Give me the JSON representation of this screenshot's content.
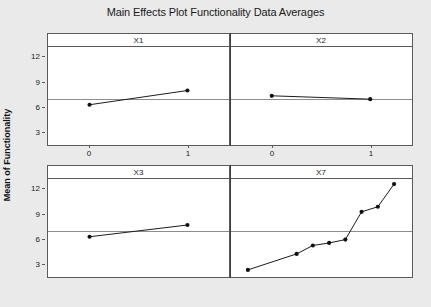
{
  "chart_data": {
    "type": "line",
    "title": "Main Effects Plot Functionality Data Averages",
    "xlabel": "",
    "ylabel": "Mean of Functionality",
    "ylim": [
      1.5,
      13.2
    ],
    "yticks": [
      3,
      6,
      9,
      12
    ],
    "grid": false,
    "legend": "none",
    "reference_line": 7.0,
    "layout": "2x2 panel grid",
    "panels": [
      {
        "name": "X1",
        "categories": [
          "0",
          "1"
        ],
        "x": [
          0,
          1
        ],
        "values": [
          6.3,
          8.0
        ]
      },
      {
        "name": "X2",
        "categories": [
          "0",
          "1"
        ],
        "x": [
          0,
          1
        ],
        "values": [
          7.4,
          7.0
        ]
      },
      {
        "name": "X3",
        "categories": [
          "0",
          "1"
        ],
        "x": [
          0,
          1
        ],
        "values": [
          6.3,
          7.7
        ]
      },
      {
        "name": "X7",
        "categories": [
          "1",
          "4",
          "5",
          "6",
          "7",
          "8",
          "9",
          "10"
        ],
        "x": [
          1,
          4,
          5,
          6,
          7,
          8,
          9,
          10
        ],
        "values": [
          2.4,
          4.3,
          5.3,
          5.6,
          6.0,
          9.3,
          9.9,
          12.6
        ]
      }
    ]
  },
  "colors": {
    "background": "#eaeaea",
    "panel_background": "#ffffff",
    "panel_border": "#5a5a5a",
    "series_line": "#1a1a1a",
    "reference_line": "#8d8d8d",
    "text": "#1a1a1a"
  }
}
